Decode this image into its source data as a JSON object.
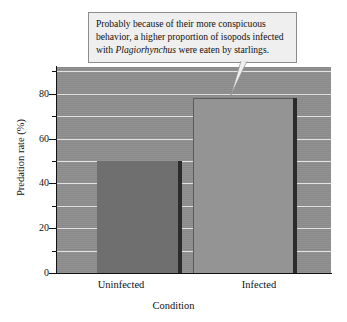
{
  "chart_data": {
    "type": "bar",
    "title": "",
    "xlabel": "Condition",
    "ylabel": "Predation rate (%)",
    "categories": [
      "Uninfected",
      "Infected"
    ],
    "values": [
      50,
      78
    ],
    "ylim": [
      0,
      92
    ],
    "y_major_ticks": [
      0,
      20,
      40,
      60,
      80
    ],
    "y_minor_ticks": [
      10,
      30,
      50,
      70,
      90
    ],
    "y_tick_labels": [
      "0",
      "20",
      "40",
      "60",
      "80"
    ],
    "grid": "horizontal",
    "legend": "none",
    "series": [
      {
        "name": "Predation rate",
        "values": [
          50,
          78
        ],
        "bar_colors": [
          "#6f6f6f",
          "#949494"
        ]
      }
    ],
    "annotations": [
      {
        "name": "callout",
        "text_lines": [
          "Probably because of their more conspicuous",
          "behavior, a higher proportion of isopods infected",
          "with Plagiorhynchus were eaten by starlings."
        ],
        "italic_term": "Plagiorhynchus",
        "points_to": "Infected"
      }
    ],
    "colors": {
      "plot_background": "#8e8e8e",
      "gridline": "#e9e9e9",
      "axis": "#111111",
      "bar_uninfected": "#6f6f6f",
      "bar_infected": "#949494",
      "bar_shadow": "#2b2b2b",
      "callout_background": "#efefef",
      "callout_border": "#8c8c8c",
      "page_background": "#ffffff"
    }
  },
  "callout": {
    "line1": "Probably because of their more conspicuous",
    "line2_a": "behavior, a higher proportion of isopods infected",
    "line3_a": "with ",
    "line3_italic": "Plagiorhynchus",
    "line3_b": " were eaten by starlings."
  },
  "axes": {
    "y_title": "Predation rate (%)",
    "x_title": "Condition",
    "y_labels": [
      "80",
      "60",
      "40",
      "20",
      "0"
    ],
    "x_labels": [
      "Uninfected",
      "Infected"
    ]
  }
}
